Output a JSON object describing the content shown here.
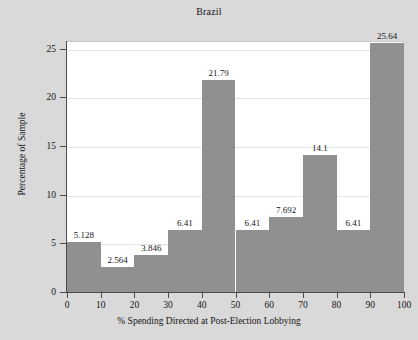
{
  "chart_data": {
    "type": "bar",
    "title": "Brazil",
    "xlabel": "% Spending Directed at Post-Election Lobbying",
    "ylabel": "Percentage of Sample",
    "categories": [
      "0-10",
      "10-20",
      "20-30",
      "30-40",
      "40-50",
      "50-60",
      "60-70",
      "70-80",
      "80-90",
      "90-100"
    ],
    "bin_edges": [
      0,
      10,
      20,
      30,
      40,
      50,
      60,
      70,
      80,
      90,
      100
    ],
    "values": [
      5.128,
      2.564,
      3.846,
      6.41,
      21.79,
      6.41,
      7.692,
      14.1,
      6.41,
      25.64
    ],
    "value_labels": [
      "5.128",
      "2.564",
      "3.846",
      "6.41",
      "21.79",
      "6.41",
      "7.692",
      "14.1",
      "6.41",
      "25.64"
    ],
    "xlim": [
      0,
      100
    ],
    "ylim": [
      0,
      25.8
    ],
    "xticks": [
      0,
      10,
      20,
      30,
      40,
      50,
      60,
      70,
      80,
      90,
      100
    ],
    "xtick_labels": [
      "0",
      "10",
      "20",
      "30",
      "40",
      "50",
      "60",
      "70",
      "80",
      "90",
      "100"
    ],
    "yticks": [
      0,
      5,
      10,
      15,
      20,
      25
    ],
    "ytick_labels": [
      "0",
      "5",
      "10",
      "15",
      "20",
      "25"
    ],
    "grid": true,
    "legend": null,
    "bar_color": "#909090",
    "plot_background": "#ffffff",
    "figure_background": "#d9d9d9",
    "axis_color": "#4a4a4a",
    "gridline_color": "#e4e4e4"
  }
}
